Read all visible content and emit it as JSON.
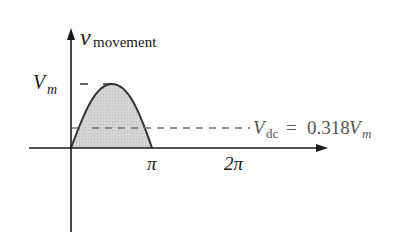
{
  "diagram": {
    "y_axis_label": {
      "symbol": "v",
      "subscript": "movement"
    },
    "peak_label": {
      "symbol": "V",
      "subscript": "m"
    },
    "dc_label": {
      "symbol": "V",
      "subscript": "dc",
      "equals": "=",
      "value_prefix": "0.318",
      "value_symbol": "V",
      "value_subscript": "m"
    },
    "x_ticks": [
      {
        "label": "π"
      },
      {
        "label": "2π"
      }
    ],
    "colors": {
      "axis": "#1a1a1a",
      "curve": "#333333",
      "fill": "#d0d0d0",
      "dashed": "#707070",
      "dc_text": "#555555"
    }
  }
}
